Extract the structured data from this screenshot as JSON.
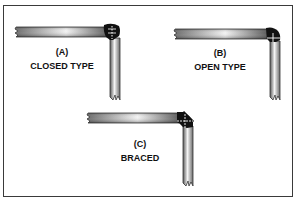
{
  "figure": {
    "panels": [
      {
        "id": "A",
        "letter": "(A)",
        "caption": "CLOSED TYPE",
        "joint": "closed"
      },
      {
        "id": "B",
        "letter": "(B)",
        "caption": "OPEN TYPE",
        "joint": "open"
      },
      {
        "id": "C",
        "letter": "(C)",
        "caption": "BRACED",
        "joint": "braced"
      }
    ],
    "colors": {
      "border": "#3a3a3a",
      "bar_dark": "#555555",
      "bar_light": "#f4f4f4",
      "joint": "#111111",
      "text": "#111111"
    }
  }
}
